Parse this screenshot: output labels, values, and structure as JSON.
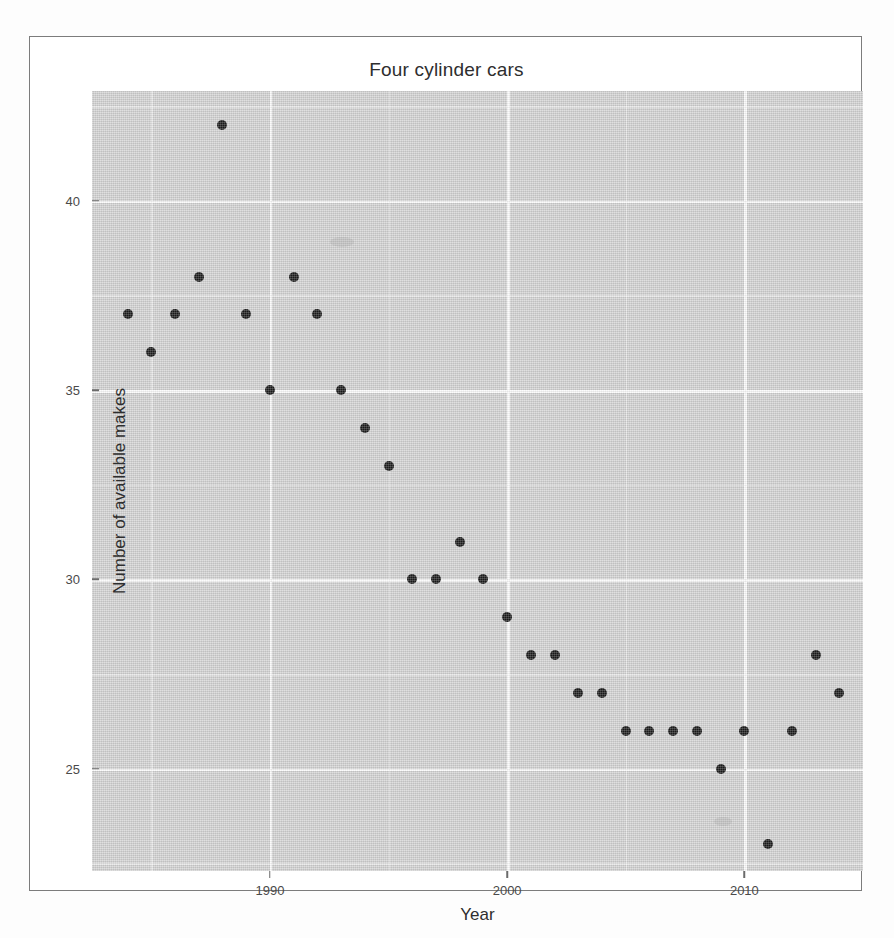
{
  "figure": {
    "title": "Four cylinder cars",
    "x_axis_title": "Year",
    "y_axis_title": "Number of available makes",
    "panel_color": "#d3d3d3",
    "grid_color": "#fcfcfc",
    "point_color": "#1a1a1a"
  },
  "axes": {
    "x_tick_labels": [
      "1990",
      "2000",
      "2010"
    ],
    "y_tick_labels": [
      "25",
      "30",
      "35",
      "40"
    ]
  },
  "chart_data": {
    "type": "scatter",
    "title": "Four cylinder cars",
    "xlabel": "Year",
    "ylabel": "Number of available makes",
    "xlim": [
      1982.5,
      2015.0
    ],
    "ylim": [
      22.3,
      42.9
    ],
    "xticks": [
      1990,
      2000,
      2010
    ],
    "yticks": [
      25,
      30,
      35,
      40
    ],
    "grid": true,
    "legend": "none",
    "x": [
      1984,
      1985,
      1986,
      1987,
      1988,
      1989,
      1990,
      1991,
      1992,
      1993,
      1994,
      1995,
      1996,
      1997,
      1998,
      1999,
      2000,
      2001,
      2002,
      2003,
      2004,
      2005,
      2006,
      2007,
      2008,
      2009,
      2010,
      2011,
      2012,
      2013,
      2014
    ],
    "y": [
      37,
      36,
      37,
      38,
      42,
      37,
      35,
      38,
      37,
      35,
      34,
      33,
      30,
      30,
      31,
      30,
      29,
      28,
      28,
      27,
      27,
      26,
      26,
      26,
      26,
      25,
      26,
      23,
      26,
      28,
      27
    ],
    "points": [
      {
        "x": 1984,
        "y": 37
      },
      {
        "x": 1985,
        "y": 36
      },
      {
        "x": 1986,
        "y": 37
      },
      {
        "x": 1987,
        "y": 38
      },
      {
        "x": 1988,
        "y": 42
      },
      {
        "x": 1989,
        "y": 37
      },
      {
        "x": 1990,
        "y": 35
      },
      {
        "x": 1991,
        "y": 38
      },
      {
        "x": 1992,
        "y": 37
      },
      {
        "x": 1993,
        "y": 35
      },
      {
        "x": 1994,
        "y": 34
      },
      {
        "x": 1995,
        "y": 33
      },
      {
        "x": 1996,
        "y": 30
      },
      {
        "x": 1997,
        "y": 30
      },
      {
        "x": 1998,
        "y": 31
      },
      {
        "x": 1999,
        "y": 30
      },
      {
        "x": 2000,
        "y": 29
      },
      {
        "x": 2001,
        "y": 28
      },
      {
        "x": 2002,
        "y": 28
      },
      {
        "x": 2003,
        "y": 27
      },
      {
        "x": 2004,
        "y": 27
      },
      {
        "x": 2005,
        "y": 26
      },
      {
        "x": 2006,
        "y": 26
      },
      {
        "x": 2007,
        "y": 26
      },
      {
        "x": 2008,
        "y": 26
      },
      {
        "x": 2009,
        "y": 25
      },
      {
        "x": 2010,
        "y": 26
      },
      {
        "x": 2011,
        "y": 23
      },
      {
        "x": 2012,
        "y": 26
      },
      {
        "x": 2013,
        "y": 28
      },
      {
        "x": 2014,
        "y": 27
      }
    ]
  }
}
